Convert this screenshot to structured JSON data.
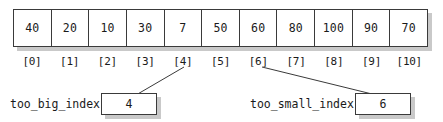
{
  "diagram": {
    "array": {
      "name": "array-cells",
      "values": [
        "40",
        "20",
        "10",
        "30",
        "7",
        "50",
        "60",
        "80",
        "100",
        "90",
        "70"
      ],
      "index_labels": [
        "[0]",
        "[1]",
        "[2]",
        "[3]",
        "[4]",
        "[5]",
        "[6]",
        "[7]",
        "[8]",
        "[9]",
        "[10]"
      ]
    },
    "variables": [
      {
        "id": "too-big-index",
        "label": "too_big_index",
        "value": "4",
        "points_to_index": "[4]"
      },
      {
        "id": "too-small-index",
        "label": "too_small_index",
        "value": "6",
        "points_to_index": "[6]"
      }
    ],
    "colors": {
      "border": "#3a3a3a",
      "shadow": "#c9c9c9",
      "background": "#ffffff",
      "text": "#1a1a1a"
    }
  }
}
